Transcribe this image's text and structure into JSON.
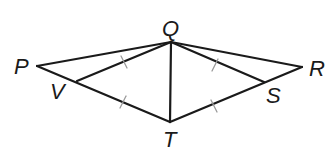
{
  "diagram": {
    "type": "geometry",
    "points": {
      "P": {
        "label": "P",
        "x": 37,
        "y": 66
      },
      "Q": {
        "label": "Q",
        "x": 171,
        "y": 42
      },
      "R": {
        "label": "R",
        "x": 302,
        "y": 67
      },
      "T": {
        "label": "T",
        "x": 170,
        "y": 122
      },
      "V": {
        "label": "V",
        "x": 77,
        "y": 81
      },
      "S": {
        "label": "S",
        "x": 264,
        "y": 82
      }
    },
    "segments": [
      "PQ",
      "QR",
      "PT",
      "RT",
      "QT",
      "QV",
      "QS"
    ],
    "congruent_marks": [
      {
        "segment": "VQ",
        "ticks": 1
      },
      {
        "segment": "VT",
        "ticks": 1
      },
      {
        "segment": "QS",
        "ticks": 1
      },
      {
        "segment": "ST",
        "ticks": 1
      }
    ],
    "colors": {
      "line": "#1a1a1a",
      "tick": "#9a9a9a",
      "background": "#ffffff"
    }
  }
}
